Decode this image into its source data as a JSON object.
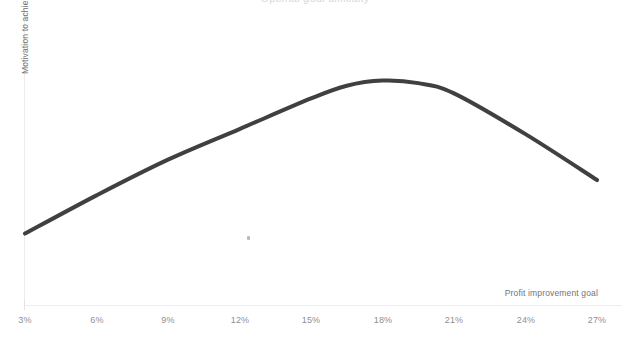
{
  "chart_data": {
    "type": "line",
    "title": "Optimal goal difficulty",
    "xlabel": "Profit improvement goal",
    "ylabel": "Motivation to achieve goal",
    "grid": false,
    "legend": false,
    "x_tick_labels": [
      "3%",
      "6%",
      "9%",
      "12%",
      "15%",
      "18%",
      "21%",
      "24%",
      "27%"
    ],
    "x_tick_values": [
      3,
      6,
      9,
      12,
      15,
      18,
      21,
      24,
      27
    ],
    "y_tick_labels": [],
    "xlim": [
      3,
      27
    ],
    "ylim": [
      0,
      100
    ],
    "series": [
      {
        "name": "Motivation",
        "color": "#404040",
        "line_width_px": 4,
        "x": [
          3,
          6,
          9,
          12,
          15,
          16.5,
          18,
          19.5,
          21,
          24,
          27
        ],
        "values": [
          28,
          43,
          57,
          69,
          81,
          86,
          88,
          87,
          83,
          67,
          49
        ]
      }
    ],
    "annotations": [],
    "colors": {
      "curve": "#404040",
      "axis": "#ececef",
      "tick_label": "#8e9094",
      "axis_label": "#72747a",
      "background": "#ffffff"
    }
  },
  "labels": {
    "y_axis": "Motivation to achieve goal",
    "x_axis": "Profit improvement goal",
    "title_cutoff": "Optimal goal difficulty"
  },
  "ticks": [
    {
      "label": "3%",
      "x_px": 25
    },
    {
      "label": "6%",
      "x_px": 97
    },
    {
      "label": "9%",
      "x_px": 168
    },
    {
      "label": "12%",
      "x_px": 240
    },
    {
      "label": "15%",
      "x_px": 311
    },
    {
      "label": "18%",
      "x_px": 383
    },
    {
      "label": "21%",
      "x_px": 454
    },
    {
      "label": "24%",
      "x_px": 526
    },
    {
      "label": "27%",
      "x_px": 597
    }
  ]
}
